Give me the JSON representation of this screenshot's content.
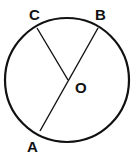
{
  "diagram": {
    "type": "circle-geometry",
    "circle": {
      "center": [
        67,
        80
      ],
      "radius": 62
    },
    "points": [
      {
        "id": "A",
        "label": "A",
        "pos": [
          40,
          131
        ],
        "label_pos": [
          27,
          152
        ]
      },
      {
        "id": "B",
        "label": "B",
        "pos": [
          98,
          28
        ],
        "label_pos": [
          95,
          20
        ]
      },
      {
        "id": "C",
        "label": "C",
        "pos": [
          37,
          28
        ],
        "label_pos": [
          29,
          20
        ]
      },
      {
        "id": "O",
        "label": "O",
        "pos": [
          68,
          80
        ],
        "label_pos": [
          75,
          93
        ]
      }
    ],
    "segments": [
      {
        "from": "A",
        "to": "B",
        "name": "diameter AB"
      },
      {
        "from": "C",
        "to": "O",
        "name": "radius OC"
      }
    ],
    "stroke_color": "#111111"
  }
}
